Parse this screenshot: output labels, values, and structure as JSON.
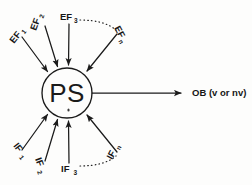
{
  "diagram": {
    "colors": {
      "ink": "#1b1b1b",
      "background": "#fdfdfc"
    },
    "center_node": {
      "label": "PS",
      "shape": "circle"
    },
    "excitatory_inputs": {
      "group_label": "EF",
      "items": [
        {
          "base": "EF",
          "sub": "1",
          "text": "EF1"
        },
        {
          "base": "EF",
          "sub": "2",
          "text": "EF2"
        },
        {
          "base": "EF",
          "sub": "3",
          "text": "EF3"
        },
        {
          "base": "EF",
          "sub": "n",
          "text": "EFn"
        }
      ]
    },
    "inhibitory_inputs": {
      "group_label": "IF",
      "items": [
        {
          "base": "IF",
          "sub": "1",
          "text": "IF1"
        },
        {
          "base": "IF",
          "sub": "2",
          "text": "IF2"
        },
        {
          "base": "IF",
          "sub": "3",
          "text": "IF3"
        },
        {
          "base": "IF",
          "sub": "n",
          "text": "IFn"
        }
      ]
    },
    "output": {
      "label": "OB (v or nv)"
    },
    "ellipsis_arcs": {
      "top": "dotted arc from EF3 to EFn",
      "bottom": "dotted arc from IF3 to IFn"
    }
  }
}
